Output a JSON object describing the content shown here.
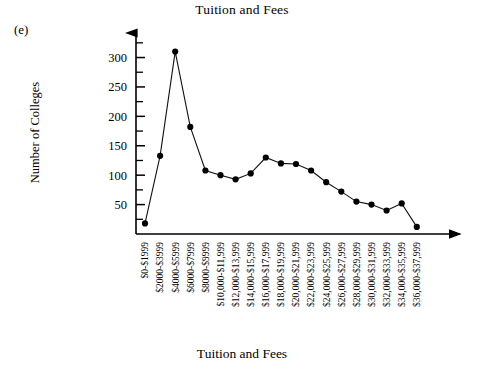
{
  "figure": {
    "panel_label": "(e)",
    "title": "Tuition and Fees",
    "xlabel": "Tuition and Fees",
    "ylabel": "Number of Colleges"
  },
  "chart_data": {
    "type": "line",
    "title": "Tuition and Fees",
    "xlabel": "Tuition and Fees",
    "ylabel": "Number of Colleges",
    "ylim": [
      0,
      340
    ],
    "grid": false,
    "legend": null,
    "y_ticks": [
      50,
      100,
      150,
      200,
      250,
      300
    ],
    "y_minor_ticks": [
      25,
      75,
      125,
      175,
      225,
      275,
      325
    ],
    "marker": "filled-circle",
    "categories": [
      "$0-$1999",
      "$2000-$3999",
      "$4000-$5999",
      "$6000-$7999",
      "$8000-$9999",
      "$10,000-$11,999",
      "$12,000-$13,999",
      "$14,000-$15,999",
      "$16,000-$17,999",
      "$18,000-$19,999",
      "$20,000-$21,999",
      "$22,000-$23,999",
      "$24,000-$25,999",
      "$26,000-$27,999",
      "$28,000-$29,999",
      "$30,000-$31,999",
      "$32,000-$33,999",
      "$34,000-$35,999",
      "$36,000-$37,999"
    ],
    "values": [
      18,
      133,
      310,
      182,
      108,
      100,
      93,
      103,
      130,
      120,
      119,
      108,
      88,
      72,
      55,
      50,
      40,
      52,
      12
    ]
  }
}
